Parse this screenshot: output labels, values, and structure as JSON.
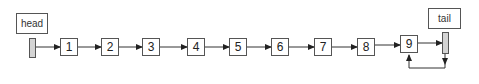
{
  "head": {
    "label": "head"
  },
  "tail": {
    "label": "tail"
  },
  "nodes": [
    {
      "label": "1",
      "x": 60
    },
    {
      "label": "2",
      "x": 101
    },
    {
      "label": "3",
      "x": 142
    },
    {
      "label": "4",
      "x": 187
    },
    {
      "label": "5",
      "x": 229
    },
    {
      "label": "6",
      "x": 271
    },
    {
      "label": "7",
      "x": 314
    },
    {
      "label": "8",
      "x": 357
    },
    {
      "label": "9",
      "x": 400
    }
  ],
  "colors": {
    "line": "#333333",
    "pointer_fill": "#d4d4d4",
    "border": "#555555"
  }
}
